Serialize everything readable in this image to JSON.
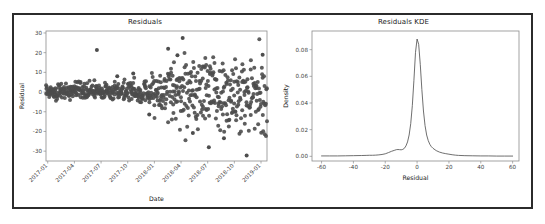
{
  "figure": {
    "background": "#ffffff",
    "frame_color": "#2b2b2b",
    "marker_color": "#4d4d4d",
    "line_color": "#555555",
    "axis_color": "#8c8c8c"
  },
  "panels": {
    "residuals": {
      "title": "Residuals"
    },
    "kde": {
      "title": "Residuals KDE"
    }
  },
  "chart_data": [
    {
      "type": "scatter",
      "title": "Residuals",
      "xlabel": "Date",
      "ylabel": "Residual",
      "grid": false,
      "legend": false,
      "xtick_labels": [
        "2017-01",
        "2017-04",
        "2017-07",
        "2017-10",
        "2018-01",
        "2018-04",
        "2018-07",
        "2018-10",
        "2019-01"
      ],
      "xtick_rotation_deg": -45,
      "ytick_labels": [
        "30",
        "20",
        "10",
        "0",
        "-10",
        "-20",
        "-30"
      ],
      "ytick_values": [
        30,
        20,
        10,
        0,
        -10,
        -20,
        -30
      ],
      "ylim": [
        -35,
        31
      ],
      "xlim_index": [
        0,
        760
      ],
      "marker": "circle",
      "marker_size_px": 2.0,
      "n_points": 640,
      "description": "Daily residuals over time showing increasing variance (heteroscedasticity) after 2018-01; early residuals cluster tightly near 0 (+/- 4), later residuals spread from about -32 to +28.",
      "series": [
        {
          "name": "Residual",
          "noise_profile": [
            {
              "x_index": 0,
              "sigma": 1.9
            },
            {
              "x_index": 120,
              "sigma": 2.1
            },
            {
              "x_index": 250,
              "sigma": 2.4
            },
            {
              "x_index": 360,
              "sigma": 3.0
            },
            {
              "x_index": 420,
              "sigma": 6.5
            },
            {
              "x_index": 500,
              "sigma": 8.5
            },
            {
              "x_index": 580,
              "sigma": 9.0
            },
            {
              "x_index": 660,
              "sigma": 9.5
            },
            {
              "x_index": 760,
              "sigma": 9.0
            }
          ],
          "mean_profile": [
            {
              "x_index": 0,
              "mu": 0.4
            },
            {
              "x_index": 300,
              "mu": 0.2
            },
            {
              "x_index": 430,
              "mu": 0.5
            },
            {
              "x_index": 560,
              "mu": -1.0
            },
            {
              "x_index": 660,
              "mu": -2.5
            },
            {
              "x_index": 760,
              "mu": -2.0
            }
          ],
          "notable_outliers": [
            {
              "x_index": 175,
              "y": 21.4
            },
            {
              "x_index": 245,
              "y": 8.0
            },
            {
              "x_index": 300,
              "y": 9.4
            },
            {
              "x_index": 355,
              "y": -11.4
            },
            {
              "x_index": 420,
              "y": 22.0
            },
            {
              "x_index": 452,
              "y": 18.7
            },
            {
              "x_index": 470,
              "y": 27.5
            },
            {
              "x_index": 505,
              "y": -20.8
            },
            {
              "x_index": 560,
              "y": -28.0
            },
            {
              "x_index": 612,
              "y": -23.4
            },
            {
              "x_index": 690,
              "y": -32.2
            },
            {
              "x_index": 745,
              "y": 18.9
            }
          ]
        }
      ]
    },
    {
      "type": "line",
      "title": "Residuals KDE",
      "xlabel": "Residual",
      "ylabel": "Density",
      "grid": false,
      "legend": false,
      "xtick_labels": [
        "-60",
        "-40",
        "-20",
        "0",
        "20",
        "40",
        "60"
      ],
      "xtick_values": [
        -60,
        -40,
        -20,
        0,
        20,
        40,
        60
      ],
      "ytick_labels": [
        "0.00",
        "0.02",
        "0.04",
        "0.06",
        "0.08"
      ],
      "ytick_values": [
        0.0,
        0.02,
        0.04,
        0.06,
        0.08
      ],
      "xlim": [
        -66,
        64
      ],
      "ylim": [
        -0.0035,
        0.094
      ],
      "peak": {
        "x": -0.5,
        "y": 0.088
      },
      "description": "Sharp leptokurtic kernel density estimate of residuals peaking near 0 at about 0.088 density, with a small left shoulder near -12 and long flat tails from -60 to 60.",
      "series": [
        {
          "name": "Density",
          "x": [
            -60,
            -55,
            -50,
            -45,
            -40,
            -35,
            -32,
            -30,
            -28,
            -26,
            -24,
            -22,
            -20,
            -18,
            -16,
            -14,
            -13,
            -12,
            -11,
            -10,
            -9,
            -8,
            -7,
            -6,
            -5,
            -4,
            -3,
            -2,
            -1,
            0,
            1,
            2,
            3,
            4,
            5,
            6,
            7,
            8,
            9,
            10,
            12,
            14,
            16,
            18,
            20,
            22,
            24,
            26,
            30,
            35,
            40,
            45,
            50,
            55,
            60
          ],
          "y": [
            0.0003,
            0.0003,
            0.0003,
            0.0004,
            0.0005,
            0.0006,
            0.0007,
            0.0008,
            0.0008,
            0.0009,
            0.0011,
            0.0014,
            0.0019,
            0.0028,
            0.0038,
            0.0046,
            0.005,
            0.0051,
            0.005,
            0.0049,
            0.0052,
            0.006,
            0.0078,
            0.0108,
            0.016,
            0.0245,
            0.038,
            0.057,
            0.078,
            0.088,
            0.084,
            0.069,
            0.05,
            0.034,
            0.023,
            0.016,
            0.0118,
            0.009,
            0.0072,
            0.006,
            0.0043,
            0.0032,
            0.0025,
            0.002,
            0.0016,
            0.0012,
            0.0009,
            0.0007,
            0.0005,
            0.0004,
            0.0003,
            0.0003,
            0.0002,
            0.0002,
            0.0002
          ]
        }
      ]
    }
  ]
}
